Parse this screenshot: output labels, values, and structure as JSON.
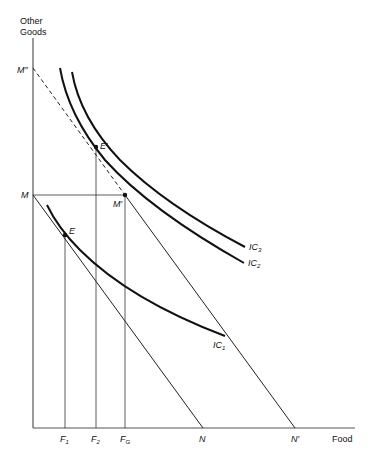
{
  "axes": {
    "y_label_line1": "Other",
    "y_label_line2": "Goods",
    "x_label": "Food"
  },
  "y_points": {
    "M_double_prime": "M″",
    "M": "M"
  },
  "x_points": {
    "F1": "F",
    "F1_sub": "1",
    "F2": "F",
    "F2_sub": "2",
    "FG": "F",
    "FG_sub": "G",
    "N": "N",
    "N_prime": "N′"
  },
  "points": {
    "E": "E",
    "E_prime": "E′",
    "M_prime": "M′"
  },
  "curves": {
    "IC1": "IC",
    "IC1_sub": "1",
    "IC2": "IC",
    "IC2_sub": "2",
    "IC3": "IC",
    "IC3_sub": "3"
  }
}
